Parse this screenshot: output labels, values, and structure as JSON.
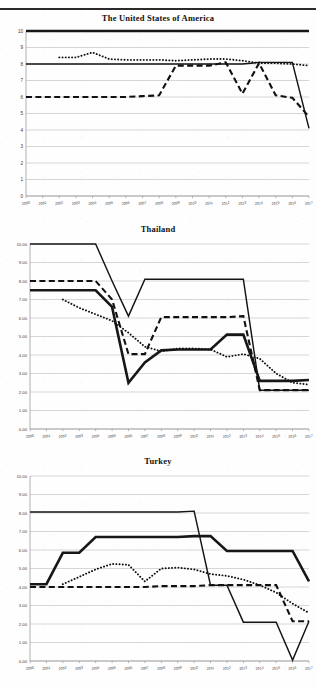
{
  "document": {
    "header_ghost_text": "",
    "page_background": "#fefefe",
    "ink_color": "#141414"
  },
  "charts": [
    {
      "id": "usa",
      "title": "The United States of America",
      "y_format": "integer",
      "y_ticks": [
        "0",
        "1",
        "2",
        "3",
        "4",
        "5",
        "6",
        "7",
        "8",
        "9",
        "10"
      ],
      "x_ticks": [
        "2000",
        "2001",
        "2002",
        "2003",
        "2004",
        "2005",
        "2006",
        "2007",
        "2008",
        "2009",
        "2010",
        "2011",
        "2012",
        "2013",
        "2014",
        "2015",
        "2016",
        "2017"
      ]
    },
    {
      "id": "thailand",
      "title": "Thailand",
      "y_format": "decimal",
      "y_ticks": [
        "0.00",
        "1.00",
        "2.00",
        "3.00",
        "4.00",
        "5.00",
        "6.00",
        "7.00",
        "8.00",
        "9.00",
        "10.00"
      ],
      "x_ticks": [
        "2000",
        "2001",
        "2002",
        "2003",
        "2004",
        "2005",
        "2006",
        "2007",
        "2008",
        "2009",
        "2010",
        "2011",
        "2012",
        "2013",
        "2014",
        "2015",
        "2016",
        "2017"
      ]
    },
    {
      "id": "turkey",
      "title": "Turkey",
      "y_format": "decimal",
      "y_ticks": [
        "0.00",
        "1.00",
        "2.00",
        "3.00",
        "4.00",
        "5.00",
        "6.00",
        "7.00",
        "8.00",
        "9.00",
        "10.00"
      ],
      "x_ticks": [
        "2000",
        "2001",
        "2002",
        "2003",
        "2004",
        "2005",
        "2006",
        "2007",
        "2008",
        "2009",
        "2010",
        "2011",
        "2012",
        "2013",
        "2014",
        "2015",
        "2016",
        "2017"
      ]
    }
  ],
  "chart_data": [
    {
      "type": "line",
      "title": "The United States of America",
      "xlabel": "",
      "ylabel": "",
      "x": [
        2000,
        2001,
        2002,
        2003,
        2004,
        2005,
        2006,
        2007,
        2008,
        2009,
        2010,
        2011,
        2012,
        2013,
        2014,
        2015,
        2016,
        2017
      ],
      "xlim": [
        2000,
        2017
      ],
      "ylim": [
        0,
        10
      ],
      "grid": true,
      "legend": "none",
      "series": [
        {
          "name": "thick-solid",
          "style": "thick-solid",
          "values": [
            10.0,
            10.0,
            10.0,
            10.0,
            10.0,
            10.0,
            10.0,
            10.0,
            10.0,
            10.0,
            10.0,
            10.0,
            10.0,
            10.0,
            10.0,
            10.0,
            10.0,
            10.0
          ]
        },
        {
          "name": "thin-solid",
          "style": "solid",
          "values": [
            8.0,
            8.0,
            8.0,
            8.0,
            8.0,
            8.0,
            8.0,
            8.0,
            8.0,
            8.0,
            8.0,
            8.0,
            8.0,
            8.0,
            8.1,
            8.1,
            8.1,
            4.1
          ]
        },
        {
          "name": "dotted",
          "style": "dotted",
          "values": [
            null,
            null,
            8.4,
            8.4,
            8.7,
            8.3,
            8.25,
            8.25,
            8.25,
            8.2,
            8.25,
            8.3,
            8.3,
            8.2,
            8.05,
            8.05,
            8.0,
            7.9
          ]
        },
        {
          "name": "dashed",
          "style": "dashed",
          "values": [
            6.0,
            6.0,
            6.0,
            6.0,
            6.0,
            6.0,
            6.0,
            6.05,
            6.1,
            7.9,
            7.9,
            7.9,
            8.1,
            6.2,
            8.05,
            6.1,
            5.95,
            4.8
          ]
        }
      ]
    },
    {
      "type": "line",
      "title": "Thailand",
      "xlabel": "",
      "ylabel": "",
      "x": [
        2000,
        2001,
        2002,
        2003,
        2004,
        2005,
        2006,
        2007,
        2008,
        2009,
        2010,
        2011,
        2012,
        2013,
        2014,
        2015,
        2016,
        2017
      ],
      "xlim": [
        2000,
        2017
      ],
      "ylim": [
        0,
        10
      ],
      "grid": true,
      "legend": "none",
      "series": [
        {
          "name": "thin-solid-upper",
          "style": "solid",
          "values": [
            10.0,
            10.0,
            10.0,
            10.0,
            10.0,
            8.0,
            6.1,
            8.1,
            8.1,
            8.1,
            8.1,
            8.1,
            8.1,
            8.1,
            2.1,
            2.1,
            2.1,
            2.1
          ]
        },
        {
          "name": "thick-solid-lower",
          "style": "thick-solid",
          "values": [
            7.5,
            7.5,
            7.5,
            7.5,
            7.5,
            6.6,
            2.5,
            3.6,
            4.25,
            4.3,
            4.3,
            4.3,
            5.1,
            5.1,
            2.6,
            2.6,
            2.6,
            2.65
          ]
        },
        {
          "name": "dotted",
          "style": "dotted",
          "values": [
            null,
            null,
            7.0,
            6.55,
            6.2,
            5.85,
            5.2,
            4.45,
            4.2,
            4.35,
            4.35,
            4.3,
            3.9,
            4.05,
            3.8,
            3.0,
            2.5,
            2.4
          ]
        },
        {
          "name": "dashed",
          "style": "dashed",
          "values": [
            8.0,
            8.0,
            8.0,
            8.0,
            8.0,
            7.0,
            4.05,
            4.05,
            6.05,
            6.05,
            6.05,
            6.05,
            6.05,
            6.1,
            2.1,
            2.1,
            2.1,
            2.1
          ]
        }
      ]
    },
    {
      "type": "line",
      "title": "Turkey",
      "xlabel": "",
      "ylabel": "",
      "x": [
        2000,
        2001,
        2002,
        2003,
        2004,
        2005,
        2006,
        2007,
        2008,
        2009,
        2010,
        2011,
        2012,
        2013,
        2014,
        2015,
        2016,
        2017
      ],
      "xlim": [
        2000,
        2017
      ],
      "ylim": [
        0,
        10
      ],
      "grid": true,
      "legend": "none",
      "series": [
        {
          "name": "thin-solid-upper",
          "style": "solid",
          "values": [
            8.05,
            8.05,
            8.05,
            8.05,
            8.05,
            8.05,
            8.05,
            8.05,
            8.05,
            8.05,
            8.1,
            4.1,
            4.1,
            2.1,
            2.1,
            2.1,
            0.05,
            2.15
          ]
        },
        {
          "name": "thick-solid",
          "style": "thick-solid",
          "values": [
            4.15,
            4.15,
            5.85,
            5.85,
            6.7,
            6.7,
            6.7,
            6.7,
            6.7,
            6.7,
            6.75,
            6.75,
            5.95,
            5.95,
            5.95,
            5.95,
            5.95,
            4.3
          ]
        },
        {
          "name": "dotted",
          "style": "dotted",
          "values": [
            null,
            null,
            4.15,
            4.55,
            4.95,
            5.25,
            5.2,
            4.3,
            5.0,
            5.05,
            4.95,
            4.7,
            4.6,
            4.4,
            4.1,
            3.7,
            3.1,
            2.6
          ]
        },
        {
          "name": "dashed",
          "style": "dashed",
          "values": [
            4.0,
            4.0,
            4.0,
            4.0,
            4.0,
            4.0,
            4.0,
            4.0,
            4.05,
            4.05,
            4.05,
            4.1,
            4.1,
            4.1,
            4.1,
            4.1,
            2.15,
            2.15
          ]
        }
      ]
    }
  ]
}
